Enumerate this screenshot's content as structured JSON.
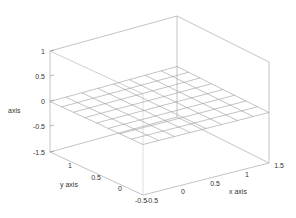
{
  "chart_data": {
    "type": "surface3d",
    "title": "",
    "xlabel": "x axis",
    "ylabel": "y axis",
    "zlabel": "axis",
    "x_ticks": [
      "-0.5",
      "0",
      "0.5",
      "1",
      "1.5"
    ],
    "y_ticks": [
      "-0.5",
      "0",
      "0.5",
      "1",
      "1.5"
    ],
    "z_ticks": [
      "1",
      "0.5",
      "0",
      "-0.5",
      "-1"
    ],
    "xlim": [
      -0.5,
      1.5
    ],
    "ylim": [
      -0.5,
      1.5
    ],
    "zlim": [
      -1,
      1
    ],
    "surface": {
      "description": "flat plane z = 0",
      "z_value": 0,
      "grid_cells_x": 8,
      "grid_cells_y": 8
    },
    "grid": false,
    "legend": null
  },
  "labels": {
    "xlabel": "x axis",
    "ylabel": "y axis",
    "zlabel": "axis",
    "z1": "1",
    "z05": "0.5",
    "z0": "0",
    "zm05": "-0.5",
    "zm1": "-1.5",
    "y1": "1",
    "y05": "0.5",
    "y0": "0",
    "ym05": "-0.5",
    "x0": "0",
    "x05": "0.5",
    "x1": "1",
    "x15": "1.5",
    "xm05": "-0.5"
  },
  "colors": {
    "axis": "#b4b4b4",
    "grid": "#9a9a9a",
    "text": "#333333"
  }
}
